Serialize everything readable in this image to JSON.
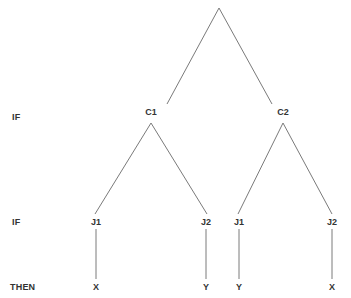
{
  "diagram": {
    "type": "decision-tree",
    "width": 351,
    "height": 298,
    "background_color": "#ffffff",
    "line_color": "#7a7a7a",
    "line_width": 1,
    "text_color": "#333333"
  },
  "row_labels": [
    {
      "id": "row-if-1",
      "text": "IF",
      "x": 12,
      "y": 117
    },
    {
      "id": "row-if-2",
      "text": "IF",
      "x": 12,
      "y": 222
    },
    {
      "id": "row-then",
      "text": "THEN",
      "x": 10,
      "y": 287
    }
  ],
  "nodes": [
    {
      "id": "root",
      "label": "",
      "x": 219,
      "y": 8,
      "level": 0
    },
    {
      "id": "c1",
      "label": "C1",
      "x": 151,
      "y": 112,
      "level": 1
    },
    {
      "id": "c2",
      "label": "C2",
      "x": 283,
      "y": 112,
      "level": 1
    },
    {
      "id": "j1a",
      "label": "J1",
      "x": 96,
      "y": 222,
      "level": 2
    },
    {
      "id": "j2a",
      "label": "J2",
      "x": 206,
      "y": 222,
      "level": 2
    },
    {
      "id": "j1b",
      "label": "J1",
      "x": 239,
      "y": 222,
      "level": 2
    },
    {
      "id": "j2b",
      "label": "J2",
      "x": 332,
      "y": 222,
      "level": 2
    },
    {
      "id": "leaf-x1",
      "label": "X",
      "x": 96,
      "y": 287,
      "level": 3
    },
    {
      "id": "leaf-y1",
      "label": "Y",
      "x": 206,
      "y": 287,
      "level": 3
    },
    {
      "id": "leaf-y2",
      "label": "Y",
      "x": 239,
      "y": 287,
      "level": 3
    },
    {
      "id": "leaf-x2",
      "label": "X",
      "x": 332,
      "y": 287,
      "level": 3
    }
  ],
  "edges": [
    {
      "id": "edge-root-c1",
      "from": "root",
      "to": "c1",
      "x1": 219,
      "y1": 8,
      "x2": 167,
      "y2": 104
    },
    {
      "id": "edge-root-c2",
      "from": "root",
      "to": "c2",
      "x1": 219,
      "y1": 8,
      "x2": 272,
      "y2": 104
    },
    {
      "id": "edge-c1-j1a",
      "from": "c1",
      "to": "j1a",
      "x1": 151,
      "y1": 123,
      "x2": 95,
      "y2": 214
    },
    {
      "id": "edge-c1-j2a",
      "from": "c1",
      "to": "j2a",
      "x1": 151,
      "y1": 123,
      "x2": 207,
      "y2": 214
    },
    {
      "id": "edge-c2-j1b",
      "from": "c2",
      "to": "j1b",
      "x1": 283,
      "y1": 123,
      "x2": 238,
      "y2": 214
    },
    {
      "id": "edge-c2-j2b",
      "from": "c2",
      "to": "j2b",
      "x1": 283,
      "y1": 123,
      "x2": 332,
      "y2": 214
    },
    {
      "id": "edge-j1a-x1",
      "from": "j1a",
      "to": "leaf-x1",
      "x1": 96,
      "y1": 229,
      "x2": 96,
      "y2": 279
    },
    {
      "id": "edge-j2a-y1",
      "from": "j2a",
      "to": "leaf-y1",
      "x1": 206,
      "y1": 229,
      "x2": 206,
      "y2": 279
    },
    {
      "id": "edge-j1b-y2",
      "from": "j1b",
      "to": "leaf-y2",
      "x1": 239,
      "y1": 229,
      "x2": 239,
      "y2": 279
    },
    {
      "id": "edge-j2b-x2",
      "from": "j2b",
      "to": "leaf-x2",
      "x1": 332,
      "y1": 229,
      "x2": 332,
      "y2": 279
    }
  ]
}
